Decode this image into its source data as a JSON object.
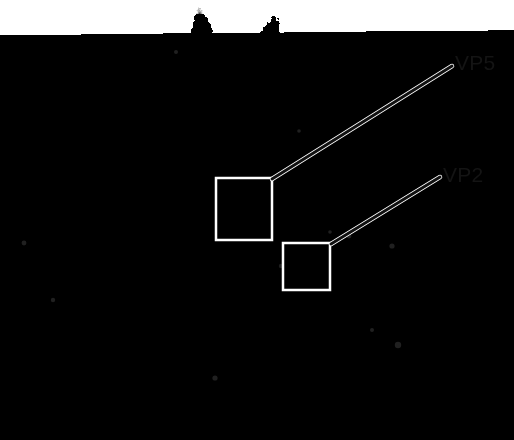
{
  "figure": {
    "type": "cryo-em-density-map",
    "background_color": "#ffffff",
    "width": 514,
    "height": 440,
    "colors": {
      "background": "#ffffff",
      "label_text": "#141414",
      "leader_line": "#111111",
      "highlight_box": "#ffffff",
      "density_light": "#f2f2f2",
      "density_mid": "#8a8a8a",
      "density_dark": "#2b2b2b"
    }
  },
  "capsid": {
    "name": "virus-capsid",
    "center_x": 214,
    "center_y": 222,
    "radius_x": 175,
    "radius_y": 192,
    "rendering": "grayscale shaded surface with knobby capsomer protrusions"
  },
  "annotations": {
    "labels": [
      {
        "id": "vp5",
        "text": "VP5",
        "x": 455,
        "y": 52,
        "leader": {
          "x1": 452,
          "y1": 66,
          "x2": 272,
          "y2": 179
        }
      },
      {
        "id": "vp2",
        "text": "VP2",
        "x": 443,
        "y": 164,
        "leader": {
          "x1": 440,
          "y1": 177,
          "x2": 331,
          "y2": 244
        }
      }
    ],
    "highlight_boxes": [
      {
        "id": "vp5-box",
        "label_ref": "VP5",
        "x": 216,
        "y": 178,
        "width": 56,
        "height": 62,
        "stroke": "#ffffff",
        "stroke_width": 2.5
      },
      {
        "id": "vp2-box",
        "label_ref": "VP2",
        "x": 283,
        "y": 243,
        "width": 47,
        "height": 47,
        "stroke": "#ffffff",
        "stroke_width": 2.5
      }
    ]
  }
}
